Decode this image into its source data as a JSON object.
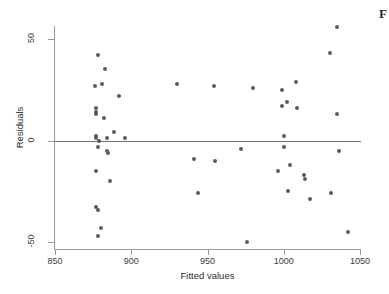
{
  "figure": {
    "corner_label": "F",
    "background": "#ffffff",
    "marker_color": "#5c5c5c",
    "axis_color": "#9a9a9a",
    "zero_line_color": "#6e6e6e"
  },
  "chart_data": {
    "type": "scatter",
    "title": "",
    "xlabel": "Fitted values",
    "ylabel": "Residuals",
    "xlim": [
      850,
      1050
    ],
    "ylim": [
      -50,
      50
    ],
    "xticks": [
      850,
      900,
      950,
      1000,
      1050
    ],
    "yticks": [
      50,
      0,
      -50
    ],
    "grid": false,
    "legend": null,
    "reference_lines": [
      {
        "orientation": "horizontal",
        "y": 0
      }
    ],
    "points": [
      {
        "x": 876,
        "y": 27
      },
      {
        "x": 877,
        "y": 16
      },
      {
        "x": 877,
        "y": 14
      },
      {
        "x": 877,
        "y": 13
      },
      {
        "x": 877,
        "y": 2
      },
      {
        "x": 877,
        "y": 1
      },
      {
        "x": 877,
        "y": -15
      },
      {
        "x": 877,
        "y": -33
      },
      {
        "x": 878,
        "y": 42
      },
      {
        "x": 878,
        "y": -3
      },
      {
        "x": 878,
        "y": -34
      },
      {
        "x": 878,
        "y": -47
      },
      {
        "x": 879,
        "y": 0
      },
      {
        "x": 880,
        "y": -43
      },
      {
        "x": 881,
        "y": 28
      },
      {
        "x": 882,
        "y": 11
      },
      {
        "x": 883,
        "y": 35
      },
      {
        "x": 884,
        "y": 1
      },
      {
        "x": 884,
        "y": -5
      },
      {
        "x": 885,
        "y": -6
      },
      {
        "x": 886,
        "y": -20
      },
      {
        "x": 889,
        "y": 4
      },
      {
        "x": 892,
        "y": 22
      },
      {
        "x": 896,
        "y": 1
      },
      {
        "x": 930,
        "y": 28
      },
      {
        "x": 941,
        "y": -9
      },
      {
        "x": 944,
        "y": -26
      },
      {
        "x": 954,
        "y": 27
      },
      {
        "x": 955,
        "y": -10
      },
      {
        "x": 972,
        "y": -4
      },
      {
        "x": 976,
        "y": -50
      },
      {
        "x": 980,
        "y": 26
      },
      {
        "x": 996,
        "y": -15
      },
      {
        "x": 999,
        "y": 25
      },
      {
        "x": 999,
        "y": 17
      },
      {
        "x": 1000,
        "y": 2
      },
      {
        "x": 1000,
        "y": -3
      },
      {
        "x": 1002,
        "y": 19
      },
      {
        "x": 1003,
        "y": -25
      },
      {
        "x": 1004,
        "y": -12
      },
      {
        "x": 1008,
        "y": 29
      },
      {
        "x": 1009,
        "y": 16
      },
      {
        "x": 1013,
        "y": -17
      },
      {
        "x": 1014,
        "y": -19
      },
      {
        "x": 1017,
        "y": -29
      },
      {
        "x": 1030,
        "y": 43
      },
      {
        "x": 1031,
        "y": -26
      },
      {
        "x": 1035,
        "y": 56
      },
      {
        "x": 1035,
        "y": 13
      },
      {
        "x": 1036,
        "y": -5
      },
      {
        "x": 1042,
        "y": -45
      }
    ]
  }
}
